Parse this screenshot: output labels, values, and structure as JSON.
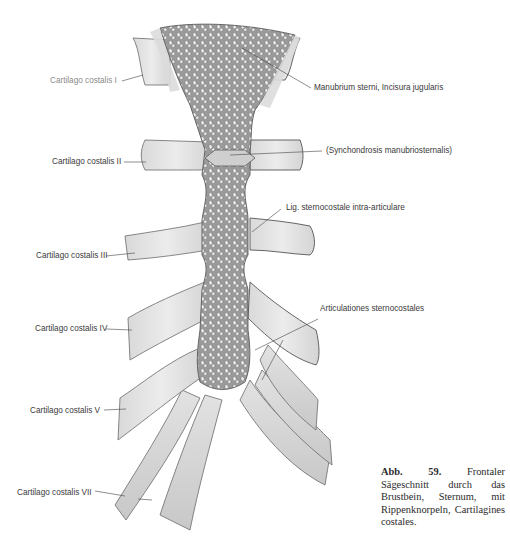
{
  "figure": {
    "title": "Frontaler Sägeschnitt durch das Brustbein",
    "labels": {
      "cartilago_i": "Cartilago costalis I",
      "cartilago_ii": "Cartilago costalis II",
      "cartilago_iii": "Cartilago costalis III",
      "cartilago_iv": "Cartilago costalis IV",
      "cartilago_v": "Cartilago costalis V",
      "cartilago_vii": "Cartilago costalis VII",
      "manubrium": "Manubrium sterni, Incisura jugularis",
      "synchondrosis": "(Synchondrosis manubriosternalis)",
      "lig": "Lig. sternocostale intra-articulare",
      "articulationes": "Articulationes sternocostales"
    },
    "caption": {
      "number": "Abb. 59.",
      "text": "Frontaler Sägeschnitt durch das Brustbein, Sternum, mit Rippenknorpeln, Cartilagines costales."
    },
    "colors": {
      "cartilage": "#e4e4e4",
      "bone": "#8c8c8c",
      "outline": "#555555",
      "leader": "#444444"
    }
  }
}
